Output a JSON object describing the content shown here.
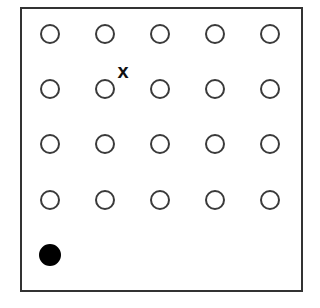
{
  "board": {
    "rows": 5,
    "cols": 5,
    "colors": {
      "border": "#333333",
      "hollow_stroke": "#3a3a3a",
      "filled": "#000000"
    },
    "cells": [
      [
        "empty",
        "empty",
        "empty",
        "empty",
        "empty"
      ],
      [
        "empty",
        "empty",
        "empty",
        "empty",
        "empty"
      ],
      [
        "empty",
        "empty",
        "empty",
        "empty",
        "empty"
      ],
      [
        "empty",
        "empty",
        "empty",
        "empty",
        "empty"
      ],
      [
        "filled",
        null,
        null,
        null,
        null
      ]
    ],
    "marker": {
      "label": "x",
      "near_row": 1,
      "near_col": 1
    }
  }
}
